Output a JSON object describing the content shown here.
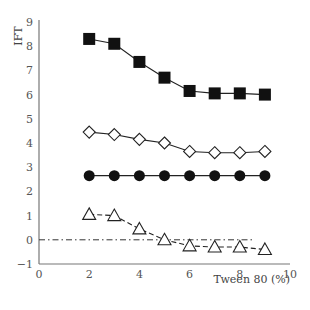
{
  "chart_data": {
    "type": "line",
    "title": "",
    "xlabel": "Tween 80 (%)",
    "ylabel": "IFT",
    "xlim": [
      0,
      10
    ],
    "ylim": [
      -1,
      9
    ],
    "xticks": [
      0,
      2,
      4,
      6,
      8,
      10
    ],
    "yticks": [
      -1,
      0,
      1,
      2,
      3,
      4,
      5,
      6,
      7,
      8,
      9
    ],
    "grid": false,
    "legend": null,
    "x": [
      2,
      3,
      4,
      5,
      6,
      7,
      8,
      9
    ],
    "series": [
      {
        "name": "filled-square",
        "marker": "square-filled",
        "line": "solid",
        "values": [
          8.3,
          8.1,
          7.35,
          6.7,
          6.15,
          6.05,
          6.05,
          6.0
        ]
      },
      {
        "name": "open-diamond",
        "marker": "diamond-open",
        "line": "solid",
        "values": [
          4.45,
          4.35,
          4.15,
          4.0,
          3.65,
          3.6,
          3.6,
          3.65
        ]
      },
      {
        "name": "filled-circle",
        "marker": "circle-filled",
        "line": "solid",
        "values": [
          2.65,
          2.65,
          2.65,
          2.65,
          2.65,
          2.65,
          2.65,
          2.65
        ]
      },
      {
        "name": "open-triangle",
        "marker": "triangle-open",
        "line": "dashed",
        "values": [
          1.05,
          1.0,
          0.45,
          0.0,
          -0.25,
          -0.3,
          -0.3,
          -0.4
        ]
      }
    ],
    "reference_lines": [
      {
        "name": "zero-line",
        "y": 0,
        "style": "dash-dot",
        "x_from": 0,
        "x_to": 8.6
      }
    ]
  }
}
